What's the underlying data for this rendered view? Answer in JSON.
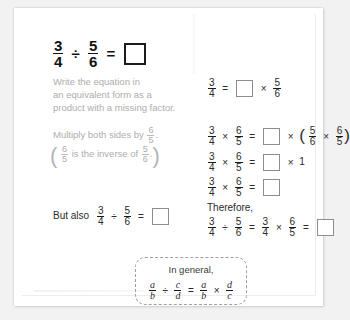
{
  "worksheet": {
    "title_equation": {
      "left_fraction": {
        "numerator": "3",
        "denominator": "4"
      },
      "divide_symbol": "÷",
      "right_fraction": {
        "numerator": "5",
        "denominator": "6"
      },
      "equals": "=",
      "answer_blank": ""
    },
    "step1": {
      "prompt_lines": [
        "Write the equation in",
        "an equivalent form as a",
        "product with a missing factor."
      ],
      "equation": {
        "lhs": {
          "numerator": "3",
          "denominator": "4"
        },
        "equals": "=",
        "blank": "",
        "times": "×",
        "rhs": {
          "numerator": "5",
          "denominator": "6"
        }
      }
    },
    "step2": {
      "prompt_text": "Multiply both sides by",
      "prompt_fraction": {
        "numerator": "6",
        "denominator": "5"
      },
      "prompt_period": ".",
      "note_open_paren": "(",
      "note_fraction_1": {
        "numerator": "6",
        "denominator": "5"
      },
      "note_text": "is the inverse of",
      "note_fraction_2": {
        "numerator": "5",
        "denominator": "6"
      },
      "note_period": ".",
      "note_close_paren": ")",
      "equations": [
        {
          "a": {
            "numerator": "3",
            "denominator": "4"
          },
          "times1": "×",
          "b": {
            "numerator": "6",
            "denominator": "5"
          },
          "equals": "=",
          "blank": "",
          "times2": "×",
          "open_paren": "(",
          "c": {
            "numerator": "5",
            "denominator": "6"
          },
          "times3": "×",
          "d": {
            "numerator": "6",
            "denominator": "5"
          },
          "close_paren": ")"
        },
        {
          "a": {
            "numerator": "3",
            "denominator": "4"
          },
          "times1": "×",
          "b": {
            "numerator": "6",
            "denominator": "5"
          },
          "equals": "=",
          "blank": "",
          "times2": "×",
          "one": "1"
        },
        {
          "a": {
            "numerator": "3",
            "denominator": "4"
          },
          "times1": "×",
          "b": {
            "numerator": "6",
            "denominator": "5"
          },
          "equals": "=",
          "blank": ""
        }
      ]
    },
    "but_also": {
      "label": "But also",
      "left_fraction": {
        "numerator": "3",
        "denominator": "4"
      },
      "divide_symbol": "÷",
      "right_fraction": {
        "numerator": "5",
        "denominator": "6"
      },
      "equals": "=",
      "blank": ""
    },
    "therefore": {
      "label": "Therefore,",
      "a": {
        "numerator": "3",
        "denominator": "4"
      },
      "divide_symbol": "÷",
      "b": {
        "numerator": "5",
        "denominator": "6"
      },
      "equals1": "=",
      "c": {
        "numerator": "3",
        "denominator": "4"
      },
      "times": "×",
      "d": {
        "numerator": "6",
        "denominator": "5"
      },
      "equals2": "=",
      "blank": ""
    },
    "general_box": {
      "title": "In general,",
      "a": {
        "numerator": "a",
        "denominator": "b"
      },
      "divide_symbol": "÷",
      "b": {
        "numerator": "c",
        "denominator": "d"
      },
      "equals": "=",
      "c": {
        "numerator": "a",
        "denominator": "b"
      },
      "times": "×",
      "d": {
        "numerator": "d",
        "denominator": "c"
      }
    }
  },
  "colors": {
    "page_background": "#ffffff",
    "outer_background": "#f2f2f2",
    "prompt_text": "#adadad",
    "equation_text": "#2a2a2a",
    "blank_border": "#8d8d8d",
    "dashed_border": "#9e9e9e"
  }
}
